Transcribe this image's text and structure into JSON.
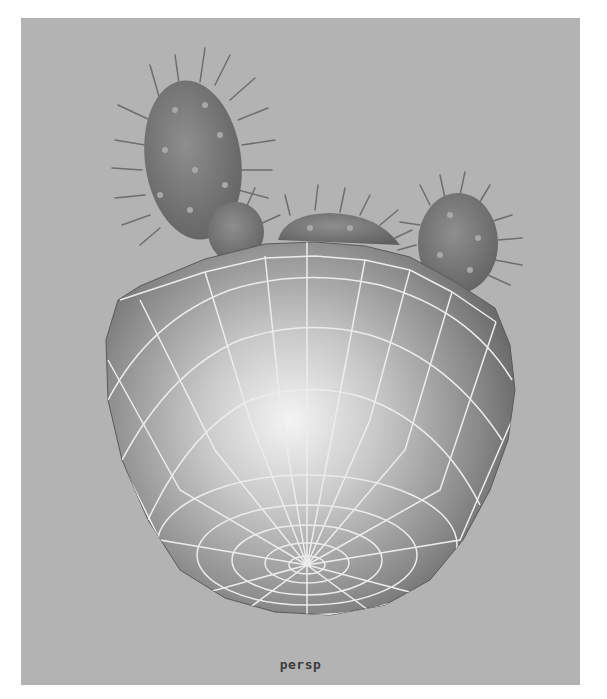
{
  "viewport": {
    "camera_label": "persp",
    "background_color": "#b3b3b3",
    "wireframe_color": "#e8e8e8",
    "shaded_color": "#7a7a7a"
  },
  "scene": {
    "objects": [
      {
        "name": "pot-hemisphere",
        "type": "poly-sphere-half",
        "display": "shaded-wireframe"
      },
      {
        "name": "cactus-pad-left",
        "type": "cactus-pad"
      },
      {
        "name": "cactus-pad-middle",
        "type": "cactus-pad"
      },
      {
        "name": "cactus-pad-center",
        "type": "cactus-pad"
      },
      {
        "name": "cactus-pad-right",
        "type": "cactus-pad"
      }
    ]
  }
}
